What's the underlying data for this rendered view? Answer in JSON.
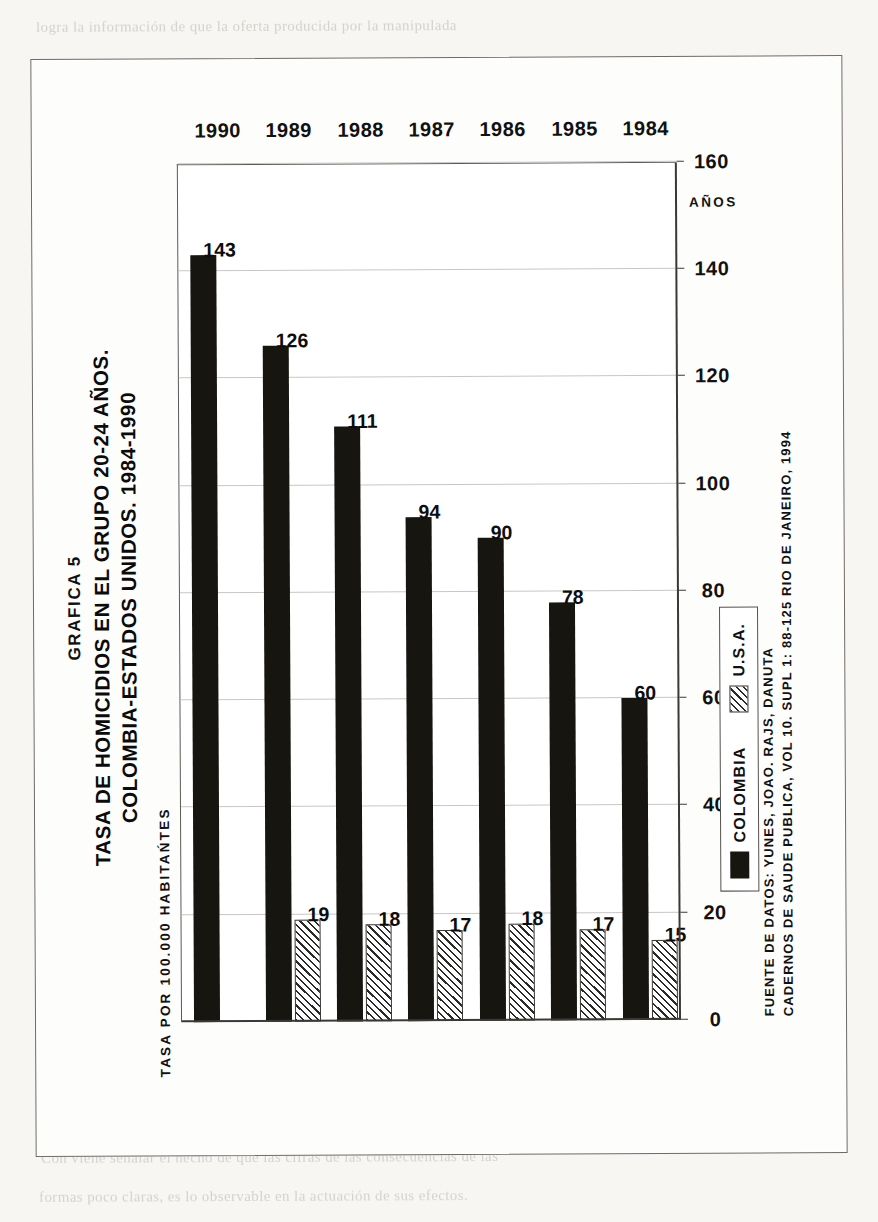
{
  "figure": {
    "number_label": "GRAFICA 5",
    "title_line1": "TASA DE HOMICIDIOS EN EL GRUPO 20-24 AÑOS.",
    "title_line2": "COLOMBIA-ESTADOS UNIDOS. 1984-1990",
    "y_axis_title": "TASA POR 100.000 HABITAŃTES",
    "x_axis_title": "AÑOS",
    "source_line1": "FUENTE DE DATOS: YUNES, JOAO. RAJS, DANUTA",
    "source_line2": "CADERNOS DE SAUDE PUBLICA, VOL 10. SUPL 1: 88-125 RIO DE JANEIRO, 1994"
  },
  "legend": {
    "items": [
      {
        "label": "COLOMBIA",
        "swatch": "solid-black"
      },
      {
        "label": "U.S.A.",
        "swatch": "hatched"
      }
    ]
  },
  "chart_data": {
    "type": "bar",
    "orientation": "horizontal",
    "title": "TASA DE HOMICIDIOS EN EL GRUPO 20-24 AÑOS. COLOMBIA-ESTADOS UNIDOS. 1984-1990",
    "subtitle": "GRAFICA 5",
    "xlabel": "AÑOS",
    "ylabel": "TASA POR 100.000 HABITAŃTES",
    "categories": [
      "1984",
      "1985",
      "1986",
      "1987",
      "1988",
      "1989",
      "1990"
    ],
    "series": [
      {
        "name": "COLOMBIA",
        "values": [
          60,
          78,
          90,
          94,
          111,
          126,
          143
        ]
      },
      {
        "name": "U.S.A.",
        "values": [
          15,
          17,
          18,
          17,
          18,
          19,
          null
        ]
      }
    ],
    "ylim": [
      0,
      160
    ],
    "yticks": [
      0,
      20,
      40,
      60,
      80,
      100,
      120,
      140,
      160
    ],
    "ticklabels": [
      "0",
      "20",
      "40",
      "60",
      "80",
      "100",
      "120",
      "140",
      "160"
    ],
    "grid": true,
    "legend_position": "lower-left-inside",
    "colors": {
      "colombia": "#16150f",
      "usa": "#2c2a26",
      "grid": "#c9c7c4",
      "axis": "#3b3936"
    }
  },
  "ghost_text": {
    "lines": [
      "logra la información de que la oferta producida por la manipulada",
      "es la dimensión que lo validan y cuando ésta no ha sido, por ello, nunca",
      "se logra la comprensión de una situación de este carácter como algo",
      "que se genera y hay que aceptar, pero por lo que es la propia",
      "realidad de una aproximación al conocimiento de la sociedad como",
      "producto histórico.",
      "Sin embargo la idea de la libertad se impone a la",
      "creación, es la posibilidad real de actuar sobre el curso de los",
      "acontecimientos mediante una adecuada lectura de ellos. La libertad",
      "no es el resultado de una circunstancia dada, sino de la actividad",
      "humana que se hace tomando conciencia.",
      "Aquí, en esto, lo importante no es sólo lo que se hace, sino",
      "el sentido y el alcance del fenómeno en la situación estructural",
      "dentro de la cual la acción se inscribe y cobra significación. De esa",
      "manera se proyecta sobre la realidad.",
      "Esto, por si mismo, no constituye un programa de acción, puesto",
      "que no indica cómo hacerlo, ni a quién hacerlo, ni cuándo hacerlo.",
      "Es el nivel de la conciencia que muestra que, no de otro modo, es",
      "posible el camino de salida de las circunstancias. Esta posibilidad",
      "es el terreno de lo posible, donde radica una ética de la acción.",
      "Todo eso parece remitir a la idea de que se han cumplido las",
      "acciones de un principio de lucha por lo que ha sido posible el crecimiento",
      "de un cuerpo crítico de nuestra sociedad. Desde un punto de vista no se",
      "puede admitir que nuestra acción, sea la realidad de que señala",
      "únicamente que el concepto requiere una acción que marca la relación",
      "práctica de la sociedad en que el hombre se constituye como un ser de",
      "acción en la vida general y social. La cuestión de un ser, por lo visto,",
      "general, y esa totalidad es la que formará parte de la relación y de la",
      "transformación práctica de la realidad en un acto de libertad.",
      "Con viene señalar el hecho de que las cifras de las consecuencias de las",
      "formas poco claras, es lo observable en la actuación de sus efectos."
    ]
  }
}
